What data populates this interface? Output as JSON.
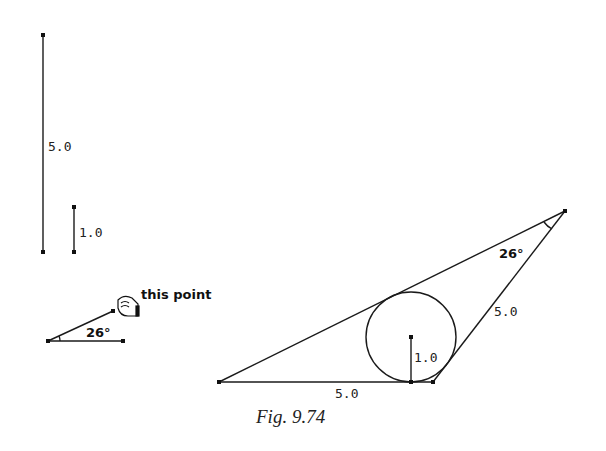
{
  "figure": {
    "caption": "Fig. 9.74"
  },
  "given": {
    "long_segment_label": "5.0",
    "short_segment_label": "1.0",
    "angle_label": "26°",
    "pointer_label": "this point"
  },
  "construction": {
    "apex_angle_label": "26°",
    "base_label": "5.0",
    "side_label": "5.0",
    "radius_label": "1.0"
  },
  "colors": {
    "stroke": "#1a1a1a",
    "background": "#ffffff"
  }
}
